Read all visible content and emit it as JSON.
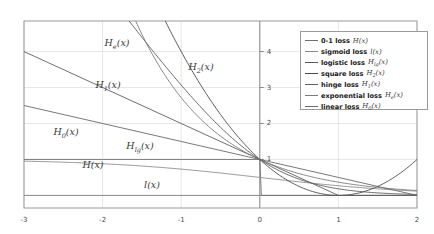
{
  "chart_data": {
    "type": "line",
    "title": "",
    "xlabel": "",
    "ylabel": "",
    "xlim": [
      -3,
      2
    ],
    "ylim": [
      -0.35,
      4.85
    ],
    "xticks": [
      -3,
      -2,
      -1,
      0,
      1,
      2
    ],
    "xticklabels": [
      "-3",
      "-2",
      "-1",
      "0",
      "1",
      "2"
    ],
    "yticks": [
      1,
      2,
      3,
      4
    ],
    "yticklabels": [
      "1",
      "2",
      "3",
      "4"
    ],
    "grid": true,
    "legend_position": "upper right",
    "series": [
      {
        "name": "0-1 loss",
        "symbol_base": "H",
        "symbol_sub": "",
        "symbol_arg": "(x)",
        "color": "#6f6f6f",
        "x": [
          -3,
          -2,
          -1,
          -0.25,
          -0.02,
          0,
          0.02,
          0.25,
          1,
          2
        ],
        "y": [
          1,
          1,
          1,
          1,
          1,
          1,
          0,
          0,
          0,
          0
        ]
      },
      {
        "name": "sigmoid loss",
        "symbol_base": "l",
        "symbol_sub": "",
        "symbol_arg": "(x)",
        "color": "#8a8a8a",
        "x": [
          -3,
          -2.5,
          -2,
          -1.5,
          -1,
          -0.5,
          0,
          0.5,
          1,
          1.5,
          2
        ],
        "y": [
          0.8,
          0.78,
          0.76,
          0.73,
          0.68,
          0.6,
          0.5,
          0.4,
          0.31,
          0.24,
          0.19
        ]
      },
      {
        "name": "logistic loss",
        "symbol_base": "H",
        "symbol_sub": "lg",
        "symbol_arg": "(x)",
        "color": "#5a5a5a",
        "x": [
          -3,
          -2.5,
          -2,
          -1.5,
          -1,
          -0.5,
          0,
          0.5,
          1,
          1.5,
          2
        ],
        "y": [
          3.12,
          2.64,
          2.19,
          1.78,
          1.41,
          1.1,
          0.85,
          0.65,
          0.49,
          0.37,
          0.28
        ]
      },
      {
        "name": "square loss",
        "symbol_base": "H",
        "symbol_sub": "2",
        "symbol_arg": "(x)",
        "color": "#4a4a4a",
        "x": [
          -3,
          -2.5,
          -2,
          -1.5,
          -1,
          -0.5,
          0,
          0.5,
          1,
          1.5,
          2
        ],
        "y": [
          16,
          12.25,
          9,
          6.25,
          4,
          2.25,
          1,
          0.25,
          0,
          0.25,
          1
        ]
      },
      {
        "name": "hinge loss",
        "symbol_base": "H",
        "symbol_sub": "1",
        "symbol_arg": "(x)",
        "color": "#5f5f5f",
        "x": [
          -3,
          -2,
          -1,
          0,
          1,
          2
        ],
        "y": [
          4,
          3,
          2,
          1,
          0,
          0
        ]
      },
      {
        "name": "exponential loss",
        "symbol_base": "H",
        "symbol_sub": "e",
        "symbol_arg": "(x)",
        "color": "#7a7a7a",
        "x": [
          -3,
          -2.5,
          -2,
          -1.5,
          -1,
          -0.5,
          0,
          0.5,
          1,
          1.5,
          2
        ],
        "y": [
          20.09,
          12.18,
          7.39,
          4.48,
          2.72,
          1.65,
          1,
          0.61,
          0.37,
          0.22,
          0.14
        ]
      },
      {
        "name": "linear loss",
        "symbol_base": "H",
        "symbol_sub": "0",
        "symbol_arg": "(x)",
        "color": "#6a6a6a",
        "x": [
          -3,
          -2,
          -1,
          0,
          1,
          2
        ],
        "y": [
          2.5,
          2.0,
          1.5,
          1.0,
          0.5,
          0.0
        ]
      }
    ],
    "curve_annotations": [
      {
        "base": "H",
        "sub": "e",
        "arg": "(x)",
        "x_px": 117,
        "y_px": 44
      },
      {
        "base": "H",
        "sub": "2",
        "arg": "(x)",
        "x_px": 201,
        "y_px": 68
      },
      {
        "base": "H",
        "sub": "1",
        "arg": "(x)",
        "x_px": 108,
        "y_px": 86
      },
      {
        "base": "H",
        "sub": "0",
        "arg": "(x)",
        "x_px": 66,
        "y_px": 133
      },
      {
        "base": "H",
        "sub": "lg",
        "arg": "(x)",
        "x_px": 140,
        "y_px": 147
      },
      {
        "base": "H",
        "sub": "",
        "arg": "(x)",
        "x_px": 93,
        "y_px": 164
      },
      {
        "base": "l",
        "sub": "",
        "arg": "(x)",
        "x_px": 152,
        "y_px": 184
      }
    ]
  },
  "axes": {
    "frame": {
      "left_px": 24,
      "top_px": 21,
      "right_px": 417,
      "bottom_px": 208
    },
    "colors": {
      "frame": "#9a9a9a",
      "grid": "#dcdcdc",
      "axis": "#8a8a8a",
      "tick_text": "#4a4a4a"
    }
  }
}
